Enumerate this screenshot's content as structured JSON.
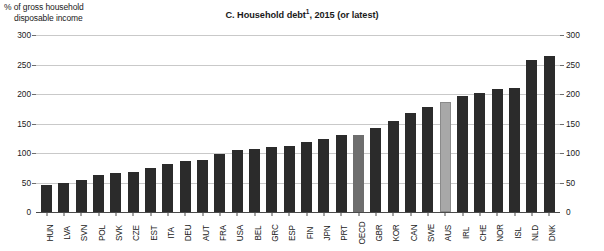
{
  "axis_caption": {
    "line1": "% of gross household",
    "line2": "disposable income"
  },
  "title": {
    "text": "C. Household debt",
    "footnote_marker": "1",
    "suffix": ", 2015 (or latest)"
  },
  "colors": {
    "bar_default": "#2b2b2b",
    "bar_oecd": "#6e6e6e",
    "bar_highlight_aus": "#a8a8a8",
    "gridline": "#c9c9c9",
    "axis": "#4a4a4a"
  },
  "chart_data": {
    "type": "bar",
    "xlabel": "",
    "ylabel": "% of gross household disposable income",
    "ylim": [
      0,
      300
    ],
    "yticks": [
      0,
      50,
      100,
      150,
      200,
      250,
      300
    ],
    "grid": true,
    "legend_position": "none",
    "dual_axis": true,
    "categories": [
      "HUN",
      "LVA",
      "SVN",
      "POL",
      "SVK",
      "CZE",
      "EST",
      "ITA",
      "DEU",
      "AUT",
      "FRA",
      "USA",
      "BEL",
      "GRC",
      "ESP",
      "FIN",
      "JPN",
      "PRT",
      "OECD",
      "GBR",
      "KOR",
      "CAN",
      "SWE",
      "AUS",
      "IRL",
      "CHE",
      "NOR",
      "ISL",
      "NLD",
      "DNK"
    ],
    "values": [
      46,
      49,
      54,
      62,
      66,
      67,
      75,
      81,
      86,
      88,
      98,
      105,
      107,
      110,
      112,
      118,
      124,
      130,
      131,
      142,
      154,
      168,
      178,
      187,
      196,
      202,
      208,
      210,
      258,
      265
    ],
    "highlights": {
      "OECD": "aggregate",
      "AUS": "country-of-interest"
    },
    "series": [
      {
        "name": "Household debt, % of gross household disposable income",
        "values": [
          46,
          49,
          54,
          62,
          66,
          67,
          75,
          81,
          86,
          88,
          98,
          105,
          107,
          110,
          112,
          118,
          124,
          130,
          131,
          142,
          154,
          168,
          178,
          187,
          196,
          202,
          208,
          210,
          258,
          265
        ]
      }
    ]
  }
}
